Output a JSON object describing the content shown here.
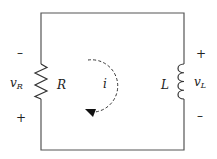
{
  "diagram": {
    "type": "series RL circuit",
    "wire_color": "#555555",
    "components": {
      "resistor": {
        "label": "R",
        "voltage_label": "v",
        "voltage_sub": "R",
        "top_sign": "–",
        "bottom_sign": "+"
      },
      "inductor": {
        "label": "L",
        "voltage_label": "v",
        "voltage_sub": "L",
        "top_sign": "+",
        "bottom_sign": "–"
      }
    },
    "current": {
      "label": "i",
      "direction": "clockwise"
    }
  }
}
